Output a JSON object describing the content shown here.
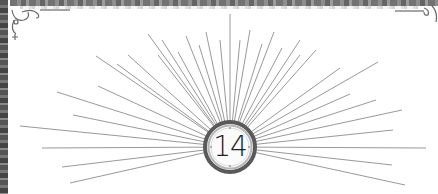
{
  "chapter": {
    "number": "14"
  },
  "ornament": {
    "type": "sunburst",
    "center": [
      230,
      147
    ],
    "ray_color": "#8a8a8a",
    "border_color": "#5a5a5a"
  }
}
